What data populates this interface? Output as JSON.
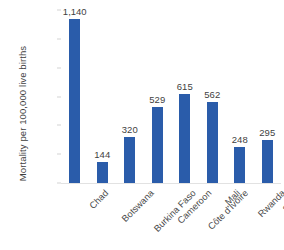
{
  "chart_data": {
    "type": "bar",
    "title": "",
    "subtitle": "",
    "xlabel": "",
    "ylabel": "Mortality per 100,000 live births",
    "categories": [
      "Chad",
      "Botswana",
      "Burkina Faso",
      "Cameroon",
      "Côte d'Ivoire",
      "Mali",
      "Rwanda",
      "Sudan"
    ],
    "values": [
      1140,
      144,
      320,
      529,
      615,
      562,
      248,
      295
    ],
    "value_labels": [
      "1,140",
      "144",
      "320",
      "529",
      "615",
      "562",
      "248",
      "295"
    ],
    "ylim": [
      0,
      1200
    ],
    "ytick_values": [
      0,
      200,
      400,
      600,
      800,
      1000,
      1200
    ],
    "ytick_labels": [
      "0",
      "200",
      "400",
      "600",
      "800",
      "1,000",
      "1,200"
    ],
    "grid": false,
    "legend": null,
    "legend_position": "none",
    "bar_color": "#2a5caa",
    "label_color": "#3f3f3f",
    "tick_color": "#5b5b5b",
    "axis_color": "#e2e2e2",
    "background": "#ffffff",
    "xtick_rotation": -45
  }
}
